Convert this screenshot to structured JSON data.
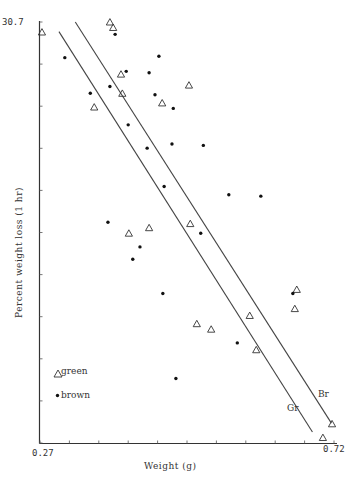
{
  "chart_data": {
    "type": "scatter",
    "title": "",
    "xlabel": "Weight (g)",
    "ylabel": "Percent weight loss (1 hr)",
    "xlim": [
      0.27,
      0.72
    ],
    "ylim": [
      0,
      30.7
    ],
    "x_tick_labels": [
      "0.27",
      "0.72"
    ],
    "y_tick_labels": [
      "30.7"
    ],
    "x_tick_count": 11,
    "y_tick_count": 11,
    "grid": false,
    "legend_position": "lower-left inside",
    "legend": [
      {
        "name": "green",
        "marker": "triangle-open"
      },
      {
        "name": "brown",
        "marker": "dot-filled"
      }
    ],
    "series": [
      {
        "name": "green",
        "marker": "triangle-open",
        "points": [
          [
            0.273,
            29.97
          ],
          [
            0.377,
            30.7
          ],
          [
            0.382,
            30.3
          ],
          [
            0.394,
            26.9
          ],
          [
            0.396,
            25.5
          ],
          [
            0.353,
            24.5
          ],
          [
            0.498,
            26.1
          ],
          [
            0.457,
            24.8
          ],
          [
            0.406,
            15.3
          ],
          [
            0.437,
            15.7
          ],
          [
            0.5,
            16.0
          ],
          [
            0.663,
            11.2
          ],
          [
            0.66,
            9.8
          ],
          [
            0.591,
            9.3
          ],
          [
            0.51,
            8.7
          ],
          [
            0.532,
            8.3
          ],
          [
            0.601,
            6.8
          ],
          [
            0.717,
            1.4
          ],
          [
            0.703,
            0.4
          ]
        ]
      },
      {
        "name": "brown",
        "marker": "dot-filled",
        "points": [
          [
            0.308,
            28.1
          ],
          [
            0.385,
            29.8
          ],
          [
            0.452,
            28.2
          ],
          [
            0.402,
            27.1
          ],
          [
            0.437,
            27.0
          ],
          [
            0.377,
            26.0
          ],
          [
            0.347,
            25.5
          ],
          [
            0.446,
            25.4
          ],
          [
            0.474,
            24.4
          ],
          [
            0.405,
            23.2
          ],
          [
            0.434,
            21.5
          ],
          [
            0.472,
            21.8
          ],
          [
            0.52,
            21.7
          ],
          [
            0.46,
            18.7
          ],
          [
            0.559,
            18.1
          ],
          [
            0.608,
            18.0
          ],
          [
            0.374,
            16.1
          ],
          [
            0.516,
            15.3
          ],
          [
            0.423,
            14.3
          ],
          [
            0.412,
            13.4
          ],
          [
            0.458,
            10.9
          ],
          [
            0.657,
            10.9
          ],
          [
            0.572,
            7.3
          ],
          [
            0.478,
            4.7
          ]
        ]
      }
    ],
    "regression_lines": [
      {
        "name": "Gr",
        "label": "Gr",
        "from": [
          0.299,
          30.0
        ],
        "to": [
          0.687,
          0.8
        ]
      },
      {
        "name": "Br",
        "label": "Br",
        "from": [
          0.324,
          30.7
        ],
        "to": [
          0.716,
          1.45
        ]
      }
    ],
    "annotations": [
      "Gr",
      "Br"
    ]
  },
  "axes": {
    "x_min_label": "0.27",
    "x_max_label": "0.72",
    "y_max_label": "30.7",
    "x_title": "Weight (g)",
    "y_title": "Percent weight loss (1 hr)"
  },
  "legend": {
    "green_label": "green",
    "brown_label": "brown"
  },
  "line_labels": {
    "gr": "Gr",
    "br": "Br"
  }
}
